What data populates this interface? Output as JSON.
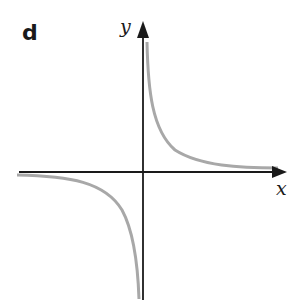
{
  "figure": {
    "panel_label": "d",
    "x_axis_label": "x",
    "y_axis_label": "y",
    "curve_description": "rectangular hyperbola y = k/x with asymptotes on the axes",
    "colors": {
      "axes": "#1a1a1a",
      "curve": "#a8a8a8",
      "background": "#ffffff"
    }
  }
}
